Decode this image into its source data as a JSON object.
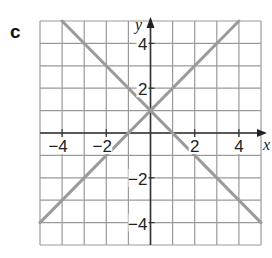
{
  "part_label": "c",
  "chart_data": {
    "type": "line",
    "title": "",
    "xlabel": "x",
    "ylabel": "y",
    "xlim": [
      -5,
      5
    ],
    "ylim": [
      -5,
      5
    ],
    "grid": true,
    "x_tick_labels": [
      "-4",
      "-2",
      "2",
      "4"
    ],
    "y_tick_labels": [
      "4",
      "2",
      "-2",
      "-4"
    ],
    "series": [
      {
        "name": "y = x + 1",
        "x": [
          -5,
          4
        ],
        "y": [
          -4,
          5
        ]
      },
      {
        "name": "y = -x + 1",
        "x": [
          -4,
          5
        ],
        "y": [
          5,
          -4
        ]
      }
    ],
    "line_color": "#9a9a9a",
    "grid_color": "#9a9a9a"
  },
  "labels": {
    "x_axis": "x",
    "y_axis": "y",
    "xticks": [
      {
        "text": "−4",
        "x": -4
      },
      {
        "text": "−2",
        "x": -2
      },
      {
        "text": "2",
        "x": 2
      },
      {
        "text": "4",
        "x": 4
      }
    ],
    "yticks": [
      {
        "text": "4",
        "y": 4
      },
      {
        "text": "2",
        "y": 2
      },
      {
        "text": "−2",
        "y": -2
      },
      {
        "text": "−4",
        "y": -4
      }
    ]
  }
}
